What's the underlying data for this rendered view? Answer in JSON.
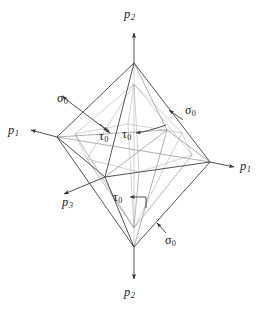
{
  "figure": {
    "background_color": "#ffffff",
    "line_color": "#4a4a4a",
    "hidden_line_color": "#9a9a9a",
    "labels": {
      "axis_top": {
        "symbol": "p",
        "sub": "2"
      },
      "axis_bottom": {
        "symbol": "p",
        "sub": "2"
      },
      "axis_left": {
        "symbol": "p",
        "sub": "1"
      },
      "axis_right": {
        "symbol": "p",
        "sub": "1"
      },
      "axis_front": {
        "symbol": "p",
        "sub": "3"
      },
      "sigma_upper_left": {
        "symbol": "σ",
        "sub": "0"
      },
      "sigma_upper_right": {
        "symbol": "σ",
        "sub": "0"
      },
      "sigma_lower_right": {
        "symbol": "σ",
        "sub": "0"
      },
      "tau_left": {
        "symbol": "τ",
        "sub": "0"
      },
      "tau_right": {
        "symbol": "τ",
        "sub": "0"
      },
      "tau_bottom": {
        "symbol": "τ",
        "sub": "0"
      }
    }
  },
  "geometry": {
    "vertices": {
      "top": [
        134,
        63
      ],
      "bottom": [
        134,
        247
      ],
      "left": [
        57,
        137
      ],
      "right": [
        210,
        162
      ],
      "front": [
        105,
        177
      ],
      "back": [
        167,
        130
      ]
    },
    "axis_tips": {
      "top": [
        134,
        30
      ],
      "bottom": [
        134,
        281
      ],
      "left": [
        30,
        128
      ],
      "right": [
        236,
        167
      ],
      "front": [
        62,
        195
      ]
    }
  }
}
